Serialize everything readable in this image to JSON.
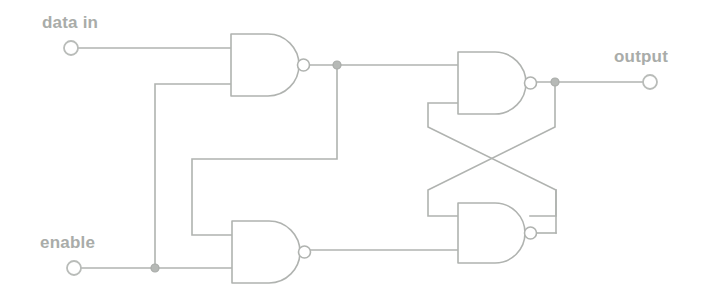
{
  "diagram": {
    "background_color": "#ffffff",
    "line_color": "#b0b3b0",
    "text_color": "#a9aca9"
  },
  "labels": {
    "data_in": "data in",
    "enable": "enable",
    "output": "output"
  },
  "terminals": [
    {
      "name": "data-in-terminal",
      "label": "data in",
      "x": 71,
      "y": 48,
      "kind": "input"
    },
    {
      "name": "enable-terminal",
      "label": "enable",
      "x": 74,
      "y": 268,
      "kind": "input"
    },
    {
      "name": "output-terminal",
      "label": "output",
      "x": 650,
      "y": 82,
      "kind": "output"
    }
  ],
  "gates": [
    {
      "name": "nand-gate-top-left",
      "type": "NAND",
      "x": 231,
      "y": 34,
      "width": 72,
      "height": 62
    },
    {
      "name": "nand-gate-top-right",
      "type": "NAND",
      "x": 458,
      "y": 52,
      "width": 72,
      "height": 62
    },
    {
      "name": "nand-gate-bottom-left",
      "type": "NAND",
      "x": 232,
      "y": 221,
      "width": 72,
      "height": 62
    },
    {
      "name": "nand-gate-bottom-right",
      "type": "NAND",
      "x": 458,
      "y": 203,
      "width": 72,
      "height": 62
    }
  ],
  "junctions": [
    {
      "name": "junction-gate1-output",
      "x": 337,
      "y": 65
    },
    {
      "name": "junction-enable-bus",
      "x": 155,
      "y": 268
    },
    {
      "name": "junction-output-node",
      "x": 555,
      "y": 82
    }
  ],
  "nets": [
    {
      "name": "net-data-in",
      "from": "data-in-terminal",
      "to": "nand-gate-top-left.in1"
    },
    {
      "name": "net-enable",
      "from": "enable-terminal",
      "to": "nand-gate-bottom-left.in2"
    },
    {
      "name": "net-enable-branch",
      "from": "junction-enable-bus",
      "to": "nand-gate-top-left.in2"
    },
    {
      "name": "net-gate1-out",
      "from": "nand-gate-top-left.out",
      "to": "nand-gate-top-right.in1"
    },
    {
      "name": "net-gate1-feedback",
      "from": "junction-gate1-output",
      "to": "nand-gate-bottom-left.in1"
    },
    {
      "name": "net-gate3-out",
      "from": "nand-gate-bottom-left.out",
      "to": "nand-gate-bottom-right.in2"
    },
    {
      "name": "net-cross-q",
      "from": "junction-output-node",
      "to": "nand-gate-bottom-right.in1"
    },
    {
      "name": "net-cross-qbar",
      "from": "nand-gate-bottom-right.out",
      "to": "nand-gate-top-right.in2"
    },
    {
      "name": "net-output",
      "from": "junction-output-node",
      "to": "output-terminal"
    }
  ]
}
